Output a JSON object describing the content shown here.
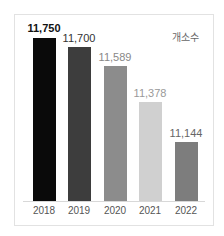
{
  "chart_data": {
    "type": "bar",
    "title": "",
    "unit_label": "개소수",
    "xlabel": "",
    "ylabel": "개소수",
    "categories": [
      "2018",
      "2019",
      "2020",
      "2021",
      "2022"
    ],
    "values": [
      11750,
      11700,
      11589,
      11378,
      11144
    ],
    "value_labels": [
      "11,750",
      "11,700",
      "11,589",
      "11,378",
      "11,144"
    ],
    "bar_colors": [
      "#0a0a0a",
      "#3d3d3d",
      "#8c8c8c",
      "#d0d0d0",
      "#7d7d7d"
    ],
    "label_colors": [
      "#111111",
      "#333333",
      "#888888",
      "#999999",
      "#666666"
    ],
    "grid": false,
    "legend": "none"
  }
}
